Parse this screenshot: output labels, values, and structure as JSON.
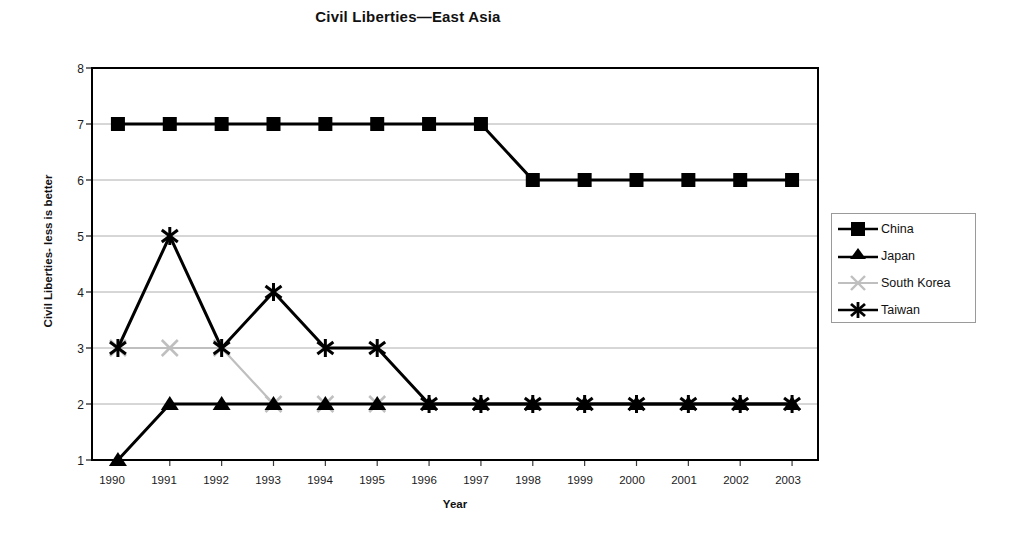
{
  "chart_data": {
    "type": "line",
    "title": "Civil Liberties—East Asia",
    "xlabel": "Year",
    "ylabel": "Civil Liberties- less is better",
    "categories": [
      "1990",
      "1991",
      "1992",
      "1993",
      "1994",
      "1995",
      "1996",
      "1997",
      "1998",
      "1999",
      "2000",
      "2001",
      "2002",
      "2003"
    ],
    "x": [
      1990,
      1991,
      1992,
      1993,
      1994,
      1995,
      1996,
      1997,
      1998,
      1999,
      2000,
      2001,
      2002,
      2003
    ],
    "ylim": [
      1,
      8
    ],
    "yticks": [
      "1",
      "2",
      "3",
      "4",
      "5",
      "6",
      "7",
      "8"
    ],
    "grid": true,
    "legend_position": "right",
    "series": [
      {
        "name": "China",
        "marker": "square",
        "color": "#000000",
        "values": [
          7,
          7,
          7,
          7,
          7,
          7,
          7,
          7,
          6,
          6,
          6,
          6,
          6,
          6
        ]
      },
      {
        "name": "Japan",
        "marker": "triangle",
        "color": "#000000",
        "values": [
          1,
          2,
          2,
          2,
          2,
          2,
          2,
          2,
          2,
          2,
          2,
          2,
          2,
          2
        ]
      },
      {
        "name": "South Korea",
        "marker": "x",
        "color": "#bfbfbf",
        "values": [
          3,
          3,
          3,
          2,
          2,
          2,
          null,
          null,
          null,
          null,
          null,
          null,
          null,
          null
        ]
      },
      {
        "name": "Taiwan",
        "marker": "asterisk",
        "color": "#000000",
        "values": [
          3,
          5,
          3,
          4,
          3,
          3,
          2,
          2,
          2,
          2,
          2,
          2,
          2,
          2
        ]
      }
    ]
  },
  "legend": {
    "items": [
      {
        "label": "China"
      },
      {
        "label": "Japan"
      },
      {
        "label": "South Korea"
      },
      {
        "label": "Taiwan"
      }
    ]
  }
}
